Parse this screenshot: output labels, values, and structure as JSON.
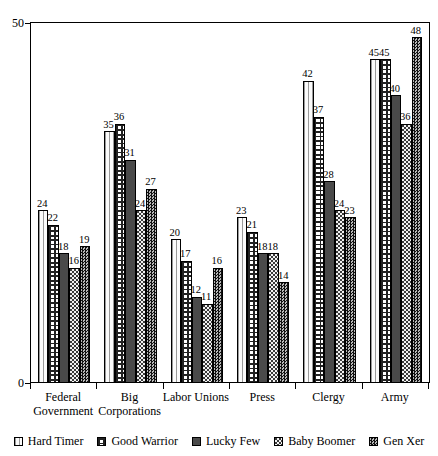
{
  "chart_data": {
    "type": "bar",
    "title": "",
    "subtitle": "",
    "xlabel": "",
    "ylabel": "",
    "ylim": [
      0,
      50
    ],
    "y_ticks": [
      0,
      50
    ],
    "y_tick_labels": [
      "0",
      "50"
    ],
    "grid": false,
    "legend_position": "bottom",
    "categories": [
      "Federal Government",
      "Big Corporations",
      "Labor Unions",
      "Press",
      "Clergy",
      "Army"
    ],
    "category_lines": [
      [
        "Federal",
        "Government"
      ],
      [
        "Big",
        "Corporations"
      ],
      [
        "Labor Unions",
        ""
      ],
      [
        "Press",
        ""
      ],
      [
        "Clergy",
        ""
      ],
      [
        "Army",
        ""
      ]
    ],
    "series": [
      {
        "name": "Hard Timer",
        "pattern": "light-dotted",
        "values": [
          24,
          35,
          20,
          23,
          42,
          45
        ]
      },
      {
        "name": "Good Warrior",
        "pattern": "brick-crosshatch",
        "values": [
          22,
          36,
          17,
          21,
          37,
          45
        ]
      },
      {
        "name": "Lucky Few",
        "pattern": "solid-dark-gray",
        "values": [
          18,
          31,
          12,
          18,
          28,
          40
        ]
      },
      {
        "name": "Baby Boomer",
        "pattern": "speckled-gray",
        "values": [
          16,
          24,
          11,
          18,
          24,
          36
        ]
      },
      {
        "name": "Gen Xer",
        "pattern": "dark-checker",
        "values": [
          19,
          27,
          16,
          14,
          23,
          48
        ]
      }
    ]
  },
  "legend": {
    "items": [
      {
        "label": "Hard Timer"
      },
      {
        "label": "Good Warrior"
      },
      {
        "label": "Lucky Few"
      },
      {
        "label": "Baby Boomer"
      },
      {
        "label": "Gen Xer"
      }
    ]
  },
  "colors": {
    "axis": "#000000",
    "plot_background": "#ffffff",
    "hard_timer": "#fbfbfb",
    "good_warrior": "#ffffff",
    "lucky_few": "#4a4a4a",
    "baby_boomer": "#f2f2f2",
    "gen_xer": "#111111"
  }
}
